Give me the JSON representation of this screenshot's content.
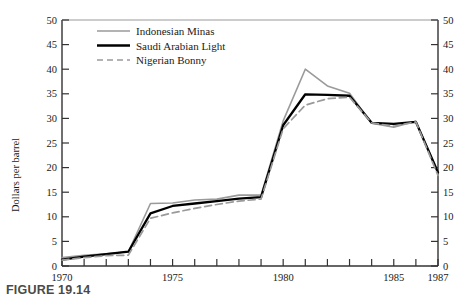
{
  "figure": {
    "caption": "FIGURE 19.14"
  },
  "chart_data": {
    "type": "line",
    "title": "",
    "xlabel": "",
    "ylabel": "Dollars per barrel",
    "xlim": [
      1970,
      1987
    ],
    "ylim": [
      0,
      50
    ],
    "grid": false,
    "legend_position": "top-left-inside",
    "y_ticks": [
      0,
      5,
      10,
      15,
      20,
      25,
      30,
      35,
      40,
      45,
      50
    ],
    "y_tick_labels": [
      "0",
      "5",
      "10",
      "15",
      "20",
      "25",
      "30",
      "35",
      "40",
      "45",
      "50"
    ],
    "y_axis_right": true,
    "y_ticks_right": [
      0,
      5,
      10,
      15,
      20,
      25,
      30,
      35,
      40,
      45,
      50
    ],
    "y_tick_labels_right": [
      "0",
      "5",
      "10",
      "15",
      "20",
      "25",
      "30",
      "35",
      "40",
      "45",
      "50"
    ],
    "x_ticks": [
      1970,
      1971,
      1972,
      1973,
      1974,
      1975,
      1976,
      1977,
      1978,
      1979,
      1980,
      1981,
      1982,
      1983,
      1984,
      1985,
      1986,
      1987
    ],
    "x_tick_labels_shown": [
      "1970",
      "1975",
      "1980",
      "1985",
      "1987"
    ],
    "x_tick_labels_shown_values": [
      1970,
      1975,
      1980,
      1985,
      1987
    ],
    "x": [
      1970,
      1971,
      1972,
      1973,
      1974,
      1975,
      1976,
      1977,
      1978,
      1979,
      1980,
      1981,
      1982,
      1983,
      1984,
      1985,
      1986,
      1987
    ],
    "series": [
      {
        "name": "Indonesian Minas",
        "color": "#9a9a9a",
        "style": "solid",
        "width": 1.6,
        "values": [
          1.7,
          2.2,
          2.5,
          2.9,
          12.7,
          12.8,
          13.4,
          13.6,
          14.4,
          14.4,
          29.5,
          40.0,
          36.6,
          35.1,
          29.0,
          28.2,
          29.4,
          19.2
        ]
      },
      {
        "name": "Saudi Arabian Light",
        "color": "#000000",
        "style": "solid",
        "width": 2.3,
        "values": [
          1.3,
          1.9,
          2.4,
          2.9,
          10.7,
          12.2,
          12.7,
          13.2,
          13.7,
          14.0,
          28.6,
          34.9,
          34.8,
          34.6,
          29.1,
          28.9,
          29.3,
          19.0
        ]
      },
      {
        "name": "Nigerian Bonny",
        "color": "#9a9a9a",
        "style": "dashed",
        "width": 1.7,
        "values": [
          1.2,
          1.7,
          2.1,
          2.2,
          9.7,
          10.8,
          11.7,
          12.5,
          13.2,
          13.6,
          27.9,
          32.7,
          34.0,
          34.3,
          29.1,
          28.4,
          29.3,
          18.4
        ]
      }
    ],
    "legend": [
      {
        "label": "Indonesian Minas",
        "color": "#9a9a9a",
        "style": "solid"
      },
      {
        "label": "Saudi Arabian Light",
        "color": "#000000",
        "style": "solid"
      },
      {
        "label": "Nigerian Bonny",
        "color": "#9a9a9a",
        "style": "dashed"
      }
    ]
  }
}
